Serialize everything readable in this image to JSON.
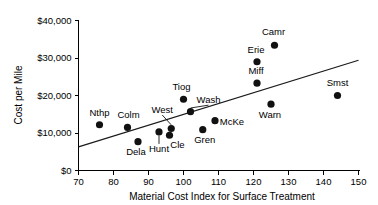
{
  "chart_data": {
    "type": "scatter",
    "title": "",
    "xlabel": "Material Cost Index for Surface Treatment",
    "ylabel": "Cost per Mile",
    "xlim": [
      70,
      150
    ],
    "ylim": [
      0,
      40000
    ],
    "grid": false,
    "legend": "none",
    "x_ticks": [
      "70",
      "80",
      "90",
      "100",
      "110",
      "120",
      "130",
      "140",
      "150"
    ],
    "x_tick_values": [
      70,
      80,
      90,
      100,
      110,
      120,
      130,
      140,
      150
    ],
    "y_ticks": [
      "$0",
      "$10,000",
      "$20,000",
      "$30,000",
      "$40,000"
    ],
    "y_tick_values": [
      0,
      10000,
      20000,
      30000,
      40000
    ],
    "point_color": "#111111",
    "line_color": "#1a1a1a",
    "points": [
      {
        "label": "Nthp",
        "x": 76,
        "y": 12200,
        "label_dx": 0,
        "label_dy": -9,
        "leader": false
      },
      {
        "label": "Colm",
        "x": 84,
        "y": 11500,
        "label_dx": 1,
        "label_dy": -9,
        "leader": false
      },
      {
        "label": "Dela",
        "x": 87,
        "y": 7700,
        "label_dx": -2,
        "label_dy": 13,
        "leader": false
      },
      {
        "label": "Hunt",
        "x": 93,
        "y": 10300,
        "label_dx": 0,
        "label_dy": 20,
        "leader": true
      },
      {
        "label": "Cle",
        "x": 96,
        "y": 9400,
        "label_dx": 8,
        "label_dy": 13,
        "leader": false
      },
      {
        "label": "West",
        "x": 96.5,
        "y": 11200,
        "label_dx": -9,
        "label_dy": -16,
        "leader": true
      },
      {
        "label": "Tiog",
        "x": 100,
        "y": 19000,
        "label_dx": -2,
        "label_dy": -9,
        "leader": false
      },
      {
        "label": "Wash",
        "x": 102,
        "y": 15700,
        "label_dx": 18,
        "label_dy": -9,
        "leader": true
      },
      {
        "label": "Gren",
        "x": 105.5,
        "y": 10900,
        "label_dx": 2,
        "label_dy": 13,
        "leader": false
      },
      {
        "label": "McKe",
        "x": 109,
        "y": 13300,
        "label_dx": 17,
        "label_dy": 4,
        "leader": false
      },
      {
        "label": "Miff",
        "x": 121,
        "y": 23300,
        "label_dx": -1,
        "label_dy": -9,
        "leader": false
      },
      {
        "label": "Erie",
        "x": 121,
        "y": 29000,
        "label_dx": -1,
        "label_dy": -9,
        "leader": false
      },
      {
        "label": "Camr",
        "x": 126,
        "y": 33400,
        "label_dx": -1,
        "label_dy": -10,
        "leader": false
      },
      {
        "label": "Warn",
        "x": 125,
        "y": 17700,
        "label_dx": -1,
        "label_dy": 14,
        "leader": false
      },
      {
        "label": "Smst",
        "x": 144,
        "y": 20000,
        "label_dx": 0,
        "label_dy": -10,
        "leader": false
      }
    ],
    "trend_line": {
      "x_start": 70,
      "y_start": 6300,
      "x_end": 150,
      "y_end": 29400
    }
  }
}
